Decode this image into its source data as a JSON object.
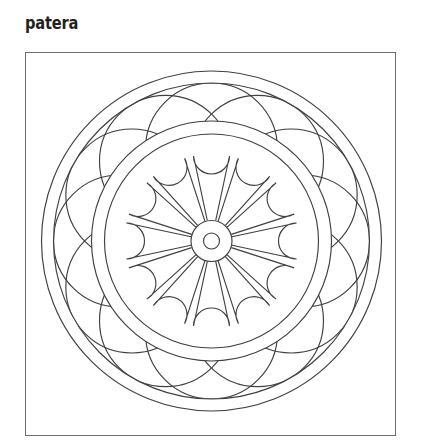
{
  "page": {
    "background_color": "#ffffff",
    "width": 422,
    "height": 446
  },
  "caption": {
    "text": "patera",
    "color": "#231f20"
  },
  "frame": {
    "border_color": "#6d6e70",
    "fill_color": "#ffffff"
  },
  "artwork": {
    "name": "patera-rosette-line-drawing",
    "stroke_color": "#3f3f44",
    "stroke_width": 1.15,
    "center": {
      "x": 185.5,
      "y": 188
    },
    "rings": [
      {
        "name": "outer-circle",
        "radius": 170
      },
      {
        "name": "outer-inner-circle",
        "radius": 158
      },
      {
        "name": "mid-band-outer-circle",
        "radius": 120
      },
      {
        "name": "mid-band-inner-circle",
        "radius": 107
      },
      {
        "name": "hub-circle",
        "radius": 20.5
      },
      {
        "name": "hub-center-ring",
        "radius": 8
      }
    ],
    "scallop_circles": {
      "count": 12,
      "center_ring_radius": 92,
      "radius": 66,
      "start_angle_deg": -90
    },
    "petals": {
      "count": 12,
      "inner_radius": 20.5,
      "outer_radius": 103,
      "tip_half_width": 18,
      "start_angle_deg": -90
    }
  }
}
